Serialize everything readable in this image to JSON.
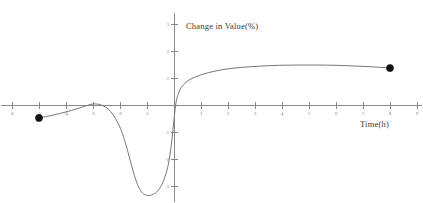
{
  "chart_data": {
    "type": "line",
    "title": "",
    "xlabel": "Time(h)",
    "ylabel": "Change in Value(%)",
    "xlim": [
      -6.4,
      9.2
    ],
    "ylim": [
      -3.6,
      3.4
    ],
    "grid": false,
    "legend": "none",
    "xticks": [
      -6,
      -5,
      -4,
      -3,
      -2,
      -1,
      1,
      2,
      3,
      4,
      5,
      6,
      7,
      8,
      9
    ],
    "xtick_labels": [
      "-6",
      "-5",
      "-4",
      "-3",
      "-2",
      "-1",
      "1",
      "2",
      "3",
      "4",
      "5",
      "6",
      "7",
      "8",
      "9"
    ],
    "yticks": [
      -3,
      -2,
      -1,
      1,
      2,
      3
    ],
    "ytick_labels": [
      "-3",
      "-2",
      "-1",
      "1",
      "2",
      "3"
    ],
    "series": [
      {
        "name": "Change in Value",
        "x": [
          -5.0,
          -4.6,
          -4.2,
          -3.8,
          -3.4,
          -3.1,
          -2.9,
          -2.7,
          -2.5,
          -2.3,
          -2.1,
          -1.95,
          -1.8,
          -1.65,
          -1.5,
          -1.35,
          -1.2,
          -1.05,
          -0.9,
          -0.75,
          -0.6,
          -0.45,
          -0.3,
          -0.18,
          -0.08,
          0.0,
          0.08,
          0.2,
          0.35,
          0.55,
          0.8,
          1.1,
          1.5,
          2.0,
          2.6,
          3.2,
          3.9,
          4.6,
          5.3,
          6.0,
          6.8,
          7.4,
          8.0
        ],
        "y": [
          -0.48,
          -0.4,
          -0.31,
          -0.2,
          -0.08,
          0.02,
          0.04,
          0.0,
          -0.1,
          -0.3,
          -0.62,
          -0.95,
          -1.4,
          -1.95,
          -2.5,
          -2.95,
          -3.22,
          -3.33,
          -3.35,
          -3.3,
          -3.18,
          -2.95,
          -2.55,
          -2.05,
          -1.3,
          -0.55,
          0.12,
          0.52,
          0.75,
          0.92,
          1.04,
          1.15,
          1.25,
          1.34,
          1.4,
          1.44,
          1.47,
          1.48,
          1.48,
          1.47,
          1.44,
          1.41,
          1.37
        ]
      }
    ],
    "marked_points": [
      {
        "name": "left-endpoint",
        "x": -5.0,
        "y": -0.48
      },
      {
        "name": "right-endpoint",
        "x": 8.0,
        "y": 1.37
      }
    ]
  },
  "axes": {
    "x_axis_title": "Time(h)",
    "y_axis_title": "Change in Value(%)"
  }
}
